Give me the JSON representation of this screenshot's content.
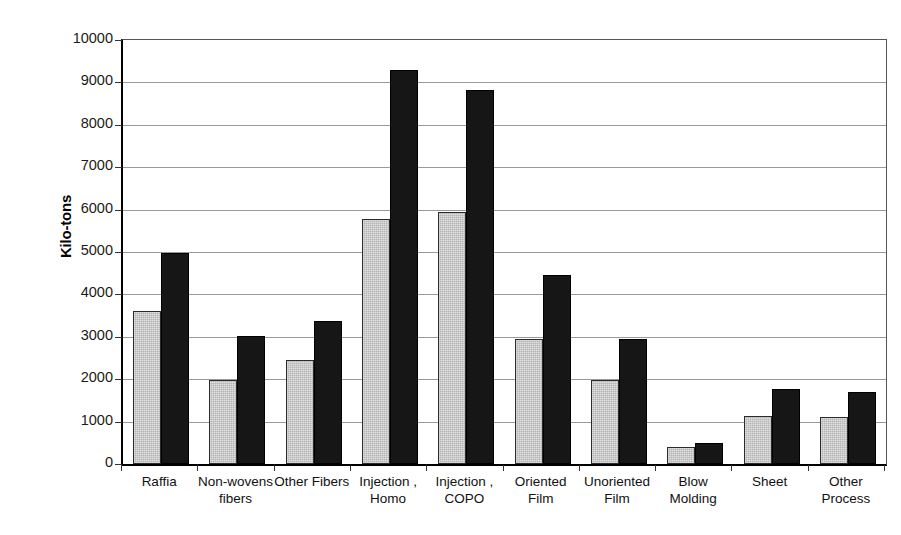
{
  "chart_data": {
    "type": "bar",
    "title": "",
    "xlabel": "",
    "ylabel": "Kilo-tons",
    "ylim": [
      0,
      10000
    ],
    "ytick_step": 1000,
    "yticks": [
      "10000",
      "9000",
      "8000",
      "7000",
      "6000",
      "5000",
      "4000",
      "3000",
      "2000",
      "1000",
      "0"
    ],
    "grid": "horizontal",
    "legend": "none",
    "grouped": true,
    "categories": [
      "Raffia",
      "Non-wovens fibers",
      "Other Fibers",
      "Injection, Homo",
      "Injection, COPO",
      "Oriented Film",
      "Unoriented Film",
      "Blow Molding",
      "Sheet",
      "Other Process"
    ],
    "category_lines": [
      [
        "Raffia",
        ""
      ],
      [
        "Non-wovens",
        "fibers"
      ],
      [
        "Other Fibers",
        ""
      ],
      [
        "Injection ,",
        "Homo"
      ],
      [
        "Injection ,",
        "COPO"
      ],
      [
        "Oriented",
        "Film"
      ],
      [
        "Unoriented",
        "Film"
      ],
      [
        "Blow",
        "Molding"
      ],
      [
        "Sheet",
        ""
      ],
      [
        "Other",
        "Process"
      ]
    ],
    "series": [
      {
        "name": "series-1-gray",
        "color": "#b4b4b4",
        "values": [
          3620,
          1970,
          2460,
          5790,
          5950,
          2950,
          1990,
          390,
          1140,
          1110
        ]
      },
      {
        "name": "series-2-black",
        "color": "#161616",
        "values": [
          4980,
          3020,
          3380,
          9290,
          8830,
          4450,
          2960,
          500,
          1780,
          1700
        ]
      }
    ]
  }
}
